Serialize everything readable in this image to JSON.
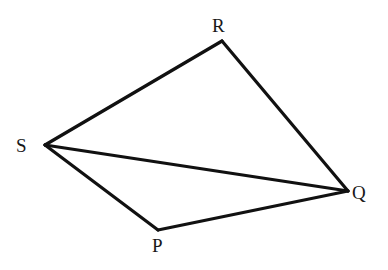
{
  "figure": {
    "name": "quadrilateral-pqrs-with-diagonal",
    "background_color": "#ffffff",
    "stroke_color": "#111111",
    "stroke_width": 3.2,
    "label_color": "#181818",
    "canvas": {
      "width": 388,
      "height": 270
    },
    "vertices": [
      {
        "id": "R",
        "label": "R",
        "x": 222,
        "y": 41,
        "label_x": 212,
        "label_y": 16
      },
      {
        "id": "S",
        "label": "S",
        "x": 45,
        "y": 145,
        "label_x": 16,
        "label_y": 136
      },
      {
        "id": "Q",
        "label": "Q",
        "x": 348,
        "y": 191,
        "label_x": 352,
        "label_y": 183
      },
      {
        "id": "P",
        "label": "P",
        "x": 158,
        "y": 230,
        "label_x": 152,
        "label_y": 236
      }
    ],
    "segments": [
      {
        "id": "SR",
        "from": "S",
        "to": "R",
        "x1": 45,
        "y1": 145,
        "x2": 222,
        "y2": 41,
        "role": "side"
      },
      {
        "id": "RQ",
        "from": "R",
        "to": "Q",
        "x1": 222,
        "y1": 41,
        "x2": 348,
        "y2": 191,
        "role": "side"
      },
      {
        "id": "SQ",
        "from": "S",
        "to": "Q",
        "x1": 45,
        "y1": 145,
        "x2": 348,
        "y2": 191,
        "role": "diagonal"
      },
      {
        "id": "SP",
        "from": "S",
        "to": "P",
        "x1": 45,
        "y1": 145,
        "x2": 158,
        "y2": 230,
        "role": "side"
      },
      {
        "id": "PQ",
        "from": "P",
        "to": "Q",
        "x1": 158,
        "y1": 230,
        "x2": 348,
        "y2": 191,
        "role": "side"
      }
    ]
  }
}
